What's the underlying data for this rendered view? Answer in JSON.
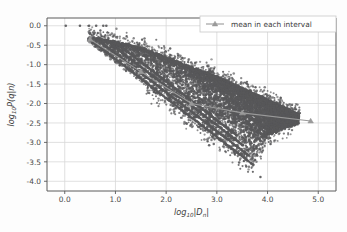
{
  "figure": {
    "background_color": "#fdfdfd",
    "plot_background_color": "#ffffff",
    "grid_color": "#d8d8d8",
    "spine_color": "#5a5a5a"
  },
  "legend": {
    "entries": [
      {
        "label": "mean in each interval",
        "color": "#9a9a9a",
        "marker": "triangle"
      }
    ],
    "position": "upper right",
    "border_color": "#c8c8c8",
    "background_color": "#ffffff"
  },
  "axes": {
    "x": {
      "title_main": "log",
      "title_sub": "10",
      "title_tail": "|D",
      "title_tail_sub": "n",
      "title_tail_end": "|",
      "title_plain": "log10|Dn|",
      "ticks": [
        "0.0",
        "1.0",
        "2.0",
        "3.0",
        "4.0",
        "5.0"
      ],
      "tick_values": [
        0.0,
        1.0,
        2.0,
        3.0,
        4.0,
        5.0
      ],
      "limits": [
        -0.35,
        5.35
      ]
    },
    "y": {
      "title_main": "log",
      "title_sub": "10",
      "title_tail": "P(q|n)",
      "title_plain": "log10P(q|n)",
      "ticks": [
        "0.0",
        "-0.5",
        "-1.0",
        "-1.5",
        "-2.0",
        "-2.5",
        "-3.0",
        "-3.5",
        "-4.0"
      ],
      "tick_values": [
        0.0,
        -0.5,
        -1.0,
        -1.5,
        -2.0,
        -2.5,
        -3.0,
        -3.5,
        -4.0
      ],
      "limits": [
        -4.25,
        0.2
      ]
    }
  },
  "chart_data": {
    "type": "scatter",
    "title": "",
    "xlabel": "log10|Dn|",
    "ylabel": "log10P(q|n)",
    "xlim": [
      -0.35,
      5.35
    ],
    "ylim": [
      -4.25,
      0.2
    ],
    "grid": true,
    "legend_position": "upper right",
    "series": [
      {
        "name": "P(q|n) samples",
        "type": "scatter",
        "color": "#58585a",
        "marker": "circle",
        "marker_size": 2.0,
        "point_count_approx": 9000,
        "description": "Dense downward-sloping wedge of points; upper envelope falls from about (0.45,-0.30) to (4.6,-2.30); lower envelope follows several sharp diagonal rays reaching about (3.7,-3.6); isolated points sit on the y=0 line near x=0.0,0.30,0.48,0.62,0.78.",
        "top_row_points": [
          {
            "x": 0.02,
            "y": 0.0
          },
          {
            "x": 0.3,
            "y": 0.0
          },
          {
            "x": 0.48,
            "y": 0.0
          },
          {
            "x": 0.62,
            "y": 0.0
          },
          {
            "x": 0.76,
            "y": 0.0
          },
          {
            "x": 0.82,
            "y": 0.0
          }
        ],
        "upper_envelope": [
          {
            "x": 0.45,
            "y": -0.28
          },
          {
            "x": 1.0,
            "y": -0.42
          },
          {
            "x": 1.5,
            "y": -0.58
          },
          {
            "x": 2.0,
            "y": -0.82
          },
          {
            "x": 2.5,
            "y": -1.08
          },
          {
            "x": 3.0,
            "y": -1.32
          },
          {
            "x": 3.5,
            "y": -1.62
          },
          {
            "x": 4.0,
            "y": -1.92
          },
          {
            "x": 4.4,
            "y": -2.16
          },
          {
            "x": 4.62,
            "y": -2.3
          }
        ],
        "lower_envelope": [
          {
            "x": 0.45,
            "y": -0.4
          },
          {
            "x": 1.0,
            "y": -0.95
          },
          {
            "x": 1.5,
            "y": -1.45
          },
          {
            "x": 2.0,
            "y": -1.95
          },
          {
            "x": 2.5,
            "y": -2.45
          },
          {
            "x": 3.0,
            "y": -2.92
          },
          {
            "x": 3.4,
            "y": -3.3
          },
          {
            "x": 3.7,
            "y": -3.58
          },
          {
            "x": 4.0,
            "y": -2.85
          },
          {
            "x": 4.4,
            "y": -2.6
          },
          {
            "x": 4.62,
            "y": -2.52
          }
        ],
        "outliers": [
          {
            "x": 3.86,
            "y": -3.89
          },
          {
            "x": 3.58,
            "y": -3.62
          },
          {
            "x": 3.44,
            "y": -3.52
          },
          {
            "x": 3.78,
            "y": -3.12
          },
          {
            "x": 4.06,
            "y": -3.04
          },
          {
            "x": 3.3,
            "y": -2.86
          },
          {
            "x": 2.98,
            "y": -2.62
          }
        ],
        "ray_lines": [
          {
            "x0": 0.47,
            "y0": -0.33,
            "x1": 3.72,
            "y1": -3.58
          },
          {
            "x0": 0.62,
            "y0": -0.33,
            "x1": 3.62,
            "y1": -3.33
          },
          {
            "x0": 0.8,
            "y0": -0.36,
            "x1": 3.52,
            "y1": -3.08
          },
          {
            "x0": 0.95,
            "y0": -0.38,
            "x1": 3.4,
            "y1": -2.83
          }
        ]
      },
      {
        "name": "mean in each interval",
        "type": "line",
        "color": "#9a9a9a",
        "marker": "triangle",
        "marker_size": 4.5,
        "line_width": 1.1,
        "x": [
          0.5,
          1.5,
          2.5,
          3.5,
          4.85
        ],
        "y": [
          -0.35,
          -1.18,
          -2.0,
          -2.24,
          -2.45
        ],
        "points": [
          {
            "x": 0.5,
            "y": -0.35
          },
          {
            "x": 1.5,
            "y": -1.18
          },
          {
            "x": 2.5,
            "y": -2.0
          },
          {
            "x": 3.5,
            "y": -2.24
          },
          {
            "x": 4.85,
            "y": -2.45
          }
        ]
      }
    ]
  }
}
